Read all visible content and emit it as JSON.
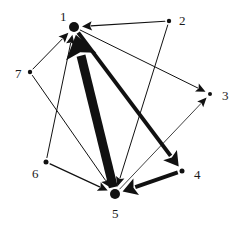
{
  "diagram": {
    "type": "directed-weighted-graph",
    "nodes": [
      {
        "id": "1",
        "label": "1",
        "x": 74,
        "y": 27,
        "r": 5.0,
        "lx": 60,
        "ly": 21
      },
      {
        "id": "2",
        "label": "2",
        "x": 169,
        "y": 21,
        "r": 2.2,
        "lx": 179,
        "ly": 25
      },
      {
        "id": "3",
        "label": "3",
        "x": 210,
        "y": 94,
        "r": 2.0,
        "lx": 222,
        "ly": 100
      },
      {
        "id": "4",
        "label": "4",
        "x": 182,
        "y": 171,
        "r": 2.5,
        "lx": 194,
        "ly": 179
      },
      {
        "id": "5",
        "label": "5",
        "x": 115,
        "y": 194,
        "r": 5.0,
        "lx": 112,
        "ly": 218
      },
      {
        "id": "6",
        "label": "6",
        "x": 46,
        "y": 162,
        "r": 2.5,
        "lx": 32,
        "ly": 178
      },
      {
        "id": "7",
        "label": "7",
        "x": 30,
        "y": 72,
        "r": 2.2,
        "lx": 15,
        "ly": 78
      }
    ],
    "edges": [
      {
        "from": "2",
        "to": "1",
        "weight": 1.2
      },
      {
        "from": "1",
        "to": "3",
        "weight": 1.0
      },
      {
        "from": "2",
        "to": "5",
        "weight": 1.0
      },
      {
        "from": "7",
        "to": "1",
        "weight": 1.0
      },
      {
        "from": "7",
        "to": "5",
        "weight": 1.0
      },
      {
        "from": "6",
        "to": "1",
        "weight": 1.0
      },
      {
        "from": "6",
        "to": "5",
        "weight": 1.2
      },
      {
        "from": "5",
        "to": "1",
        "weight": 9.0
      },
      {
        "from": "1",
        "to": "4",
        "weight": 4.0
      },
      {
        "from": "4",
        "to": "5",
        "weight": 4.0
      },
      {
        "from": "5",
        "to": "3",
        "weight": 0.8
      }
    ],
    "colors": {
      "ink": "#111111",
      "background": "#ffffff"
    }
  }
}
